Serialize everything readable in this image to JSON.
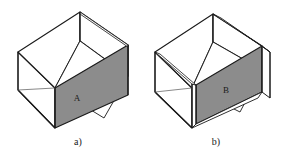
{
  "figure": {
    "background_color": "#ffffff",
    "stroke_color": "#1a1a1a",
    "shaded_face_color": "#8c8c8c",
    "white_face_color": "#ffffff",
    "text_color": "#1a1a1a"
  },
  "panels": [
    {
      "id": "panel-a",
      "caption": "a)",
      "face_label": "A",
      "description": "thin-walled open-top box, shaded right front face"
    },
    {
      "id": "panel-b",
      "caption": "b)",
      "face_label": "B",
      "description": "thick-walled open-top box, shaded right front inner face"
    }
  ]
}
